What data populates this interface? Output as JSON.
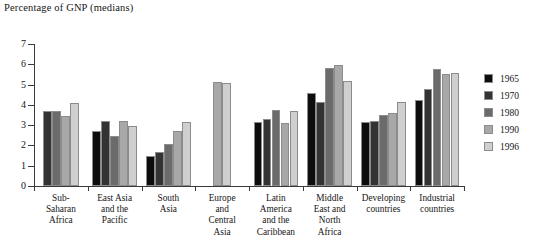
{
  "chart_data": {
    "type": "bar",
    "title": "Percentage of GNP (medians)",
    "xlabel": "",
    "ylabel": "",
    "ylim": [
      0,
      7
    ],
    "yticks": [
      0,
      1,
      2,
      3,
      4,
      5,
      6,
      7
    ],
    "ytick_labels": [
      "0",
      "1",
      "2",
      "3",
      "4",
      "5",
      "6",
      "7"
    ],
    "grid": false,
    "legend_position": "right",
    "categories": [
      "Sub-Saharan Africa",
      "East Asia and the Pacific",
      "South Asia",
      "Europe and Central Asia",
      "Latin America and the Caribbean",
      "Middle East and North Africa",
      "Developing countries",
      "Industrial countries"
    ],
    "category_label_lines": [
      [
        "Sub-",
        "Saharan",
        "Africa"
      ],
      [
        "East Asia",
        "and the",
        "Pacific"
      ],
      [
        "South",
        "Asia"
      ],
      [
        "Europe",
        "and",
        "Central",
        "Asia"
      ],
      [
        "Latin",
        "America",
        "and the",
        "Caribbean"
      ],
      [
        "Middle",
        "East and",
        "North",
        "Africa"
      ],
      [
        "Developing",
        "countries"
      ],
      [
        "Industrial",
        "countries"
      ]
    ],
    "series": [
      {
        "name": "1965",
        "color": "#0d0d0d",
        "values": [
          null,
          2.7,
          1.5,
          null,
          3.15,
          4.6,
          3.15,
          4.25
        ]
      },
      {
        "name": "1970",
        "color": "#333333",
        "values": [
          3.72,
          3.22,
          1.67,
          null,
          3.3,
          4.15,
          3.2,
          4.8
        ]
      },
      {
        "name": "1980",
        "color": "#6b6b6b",
        "values": [
          3.72,
          2.48,
          2.05,
          null,
          3.75,
          5.8,
          3.5,
          5.75
        ]
      },
      {
        "name": "1990",
        "color": "#a8a8a8",
        "values": [
          3.45,
          3.22,
          2.7,
          5.12,
          3.1,
          5.95,
          3.6,
          5.5
        ]
      },
      {
        "name": "1996",
        "color": "#cfcfcf",
        "values": [
          4.1,
          2.95,
          3.15,
          5.1,
          3.68,
          5.2,
          4.15,
          5.55
        ]
      }
    ]
  }
}
